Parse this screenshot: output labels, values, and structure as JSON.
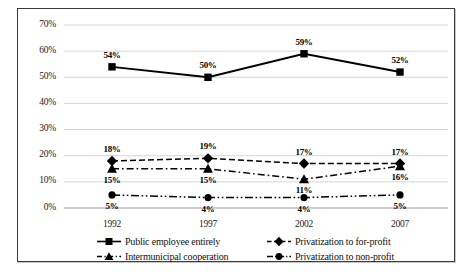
{
  "chart_data": {
    "type": "line",
    "title": "",
    "xlabel": "",
    "ylabel": "",
    "categories": [
      "1992",
      "1997",
      "2002",
      "2007"
    ],
    "ylim": [
      0,
      70
    ],
    "ytick_labels": [
      "0%",
      "10%",
      "20%",
      "30%",
      "40%",
      "50%",
      "60%",
      "70%"
    ],
    "ytick_values": [
      0,
      10,
      20,
      30,
      40,
      50,
      60,
      70
    ],
    "grid": "horizontal",
    "legend_position": "bottom",
    "value_suffix": "%",
    "series": [
      {
        "name": "Public employee entirely",
        "marker": "square",
        "line_style": "solid",
        "color": "#000000",
        "values": [
          54,
          50,
          59,
          52
        ],
        "labels": [
          "54%",
          "50%",
          "59%",
          "52%"
        ],
        "label_positions": [
          "above",
          "above",
          "above",
          "above"
        ]
      },
      {
        "name": "Privatization to for-profit",
        "marker": "diamond",
        "line_style": "dashed",
        "color": "#000000",
        "values": [
          18,
          19,
          17,
          17
        ],
        "labels": [
          "18%",
          "19%",
          "17%",
          "17%"
        ],
        "label_positions": [
          "above",
          "above",
          "above",
          "above"
        ]
      },
      {
        "name": "Intermunicipal cooperation",
        "marker": "triangle",
        "line_style": "dashdot",
        "color": "#000000",
        "values": [
          15,
          15,
          11,
          16
        ],
        "labels": [
          "15%",
          "15%",
          "11%",
          "16%"
        ],
        "label_positions": [
          "below",
          "below",
          "below",
          "below"
        ]
      },
      {
        "name": "Privatization to non-profit",
        "marker": "circle",
        "line_style": "dashdotdot",
        "color": "#000000",
        "values": [
          5,
          4,
          4,
          5
        ],
        "labels": [
          "5%",
          "4%",
          "4%",
          "5%"
        ],
        "label_positions": [
          "below",
          "below",
          "below",
          "below"
        ]
      }
    ]
  },
  "style": {
    "frame_color": "#3a3a3a",
    "grid_color": "#d0d0d0",
    "axis_color": "#9a9a9a",
    "text_color": "#1a1a1a",
    "background": "#ffffff"
  }
}
